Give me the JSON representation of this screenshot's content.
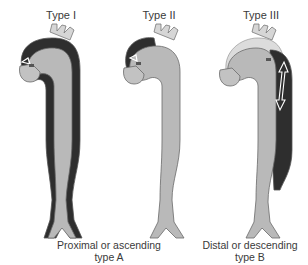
{
  "figure": {
    "types": [
      {
        "label": "Type I"
      },
      {
        "label": "Type II"
      },
      {
        "label": "Type III"
      }
    ],
    "captions": {
      "proximal": {
        "line1": "Proximal or ascending",
        "line2": "type A"
      },
      "distal": {
        "line1": "Distal or descending",
        "line2": "type B"
      }
    },
    "colors": {
      "aorta_fill": "#b9b9b9",
      "aorta_outline": "#6a6a6a",
      "false_lumen": "#2e2e2e",
      "branch_fill": "#d6d6d6"
    }
  }
}
